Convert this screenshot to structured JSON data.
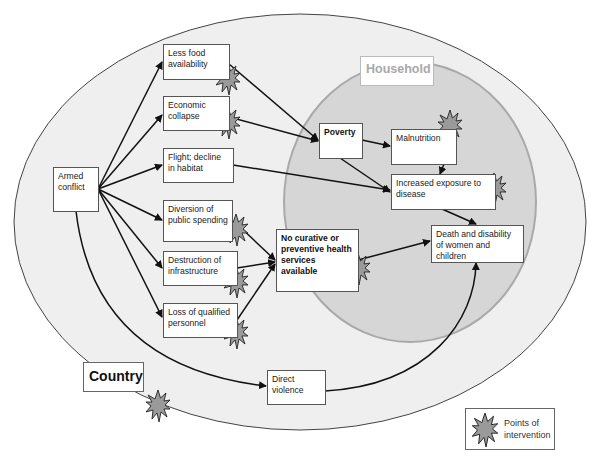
{
  "diagram": {
    "type": "causal-flow",
    "regions": {
      "country": {
        "label": "Country",
        "fill": "#efefef"
      },
      "household": {
        "label": "Household",
        "fill": "#d6d6d6",
        "stroke": "#a9a9a9"
      }
    },
    "nodes": {
      "armed_conflict": "Armed conflict",
      "less_food": "Less food availability",
      "economic_collapse": "Economic collapse",
      "flight": "Flight; decline in habitat",
      "diversion": "Diversion of public spending",
      "destruction": "Destruction of infrastructure",
      "loss_personnel": "Loss of qualified personnel",
      "no_health_services": "No curative or preventive health services available",
      "poverty": "Poverty",
      "malnutrition": "Malnutrition",
      "increased_exposure": "Increased exposure to disease",
      "death_disability": "Death and disability of women and children",
      "direct_violence": "Direct violence"
    },
    "edges": [
      [
        "armed_conflict",
        "less_food"
      ],
      [
        "armed_conflict",
        "economic_collapse"
      ],
      [
        "armed_conflict",
        "flight"
      ],
      [
        "armed_conflict",
        "diversion"
      ],
      [
        "armed_conflict",
        "destruction"
      ],
      [
        "armed_conflict",
        "loss_personnel"
      ],
      [
        "armed_conflict",
        "direct_violence"
      ],
      [
        "less_food",
        "poverty"
      ],
      [
        "economic_collapse",
        "poverty"
      ],
      [
        "flight",
        "increased_exposure"
      ],
      [
        "diversion",
        "no_health_services"
      ],
      [
        "destruction",
        "no_health_services"
      ],
      [
        "loss_personnel",
        "no_health_services"
      ],
      [
        "poverty",
        "malnutrition"
      ],
      [
        "poverty",
        "increased_exposure"
      ],
      [
        "malnutrition",
        "increased_exposure"
      ],
      [
        "increased_exposure",
        "death_disability"
      ],
      [
        "no_health_services",
        "death_disability"
      ],
      [
        "direct_violence",
        "death_disability"
      ]
    ],
    "intervention_points": [
      "less_food",
      "economic_collapse",
      "diversion",
      "destruction",
      "loss_personnel",
      "no_health_services",
      "malnutrition",
      "increased_exposure",
      "country"
    ],
    "legend": {
      "label": "Points of intervention",
      "marker_color": "#9a9a9a"
    }
  },
  "text": {
    "country": "Country",
    "household": "Household",
    "armed_conflict": "Armed conflict",
    "less_food": "Less food availability",
    "economic_collapse": "Economic collapse",
    "flight": "Flight; decline in habitat",
    "diversion": "Diversion of public spending",
    "destruction": "Destruction of infrastructure",
    "loss_personnel": "Loss of qualified personnel",
    "no_health_services": "No curative or preventive health services available",
    "poverty": "Poverty",
    "malnutrition": "Malnutrition",
    "increased_exposure": "Increased exposure to disease",
    "death_disability": "Death and disability of women and children",
    "direct_violence": "Direct violence",
    "legend": "Points of intervention"
  }
}
